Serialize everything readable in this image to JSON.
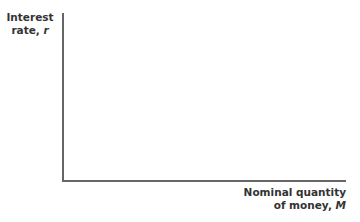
{
  "chart_data": {
    "type": "line",
    "title": "",
    "xlabel": "Nominal quantity of money, M",
    "ylabel": "Interest rate, r",
    "series": [],
    "grid": false,
    "legend": null
  },
  "labels": {
    "y_line1": "Interest",
    "y_line2": "rate, ",
    "y_var": "r",
    "x_line1": "Nominal quantity",
    "x_line2": "of money, ",
    "x_var": "M"
  }
}
